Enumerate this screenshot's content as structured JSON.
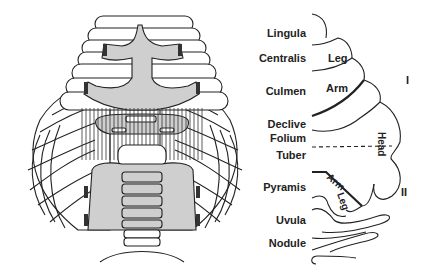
{
  "figure": {
    "lobule_labels": [
      {
        "id": "lingula",
        "text": "Lingula"
      },
      {
        "id": "centralis",
        "text": "Centralis"
      },
      {
        "id": "culmen",
        "text": "Culmen"
      },
      {
        "id": "declive",
        "text": "Declive"
      },
      {
        "id": "folium",
        "text": "Folium"
      },
      {
        "id": "tuber",
        "text": "Tuber"
      },
      {
        "id": "pyramis",
        "text": "Pyramis"
      },
      {
        "id": "uvula",
        "text": "Uvula"
      },
      {
        "id": "nodule",
        "text": "Nodule"
      }
    ],
    "body_labels": {
      "leg_upper": "Leg",
      "arm_upper": "Arm",
      "head": "Head",
      "arm_lower": "Arm",
      "leg_lower": "Leg"
    },
    "map_labels": {
      "map_one": "I",
      "map_two": "II"
    }
  }
}
